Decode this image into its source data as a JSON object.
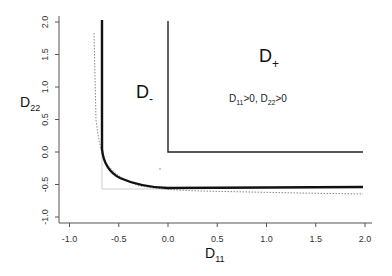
{
  "chart_data": {
    "type": "line",
    "title": "",
    "xlabel": "D11",
    "ylabel": "D22",
    "xlim": [
      -1.1,
      2.1
    ],
    "ylim": [
      -1.1,
      2.1
    ],
    "grid": false,
    "x_ticks": [
      "-1.0",
      "-0.5",
      "0.0",
      "0.5",
      "1.0",
      "1.5",
      "2.0"
    ],
    "y_ticks": [
      "-1.0",
      "-0.5",
      "0.0",
      "0.5",
      "1.0",
      "1.5",
      "2.0"
    ],
    "series": [
      {
        "name": "D- boundary (thick solid)",
        "style": "solid-thick",
        "points": [
          [
            -0.68,
            2.0
          ],
          [
            -0.68,
            0.05
          ],
          [
            -0.62,
            -0.2
          ],
          [
            -0.5,
            -0.36
          ],
          [
            -0.3,
            -0.48
          ],
          [
            -0.1,
            -0.54
          ],
          [
            0.0,
            -0.56
          ],
          [
            0.5,
            -0.56
          ],
          [
            2.0,
            -0.56
          ]
        ]
      },
      {
        "name": "D+ boundary (solid)",
        "style": "solid",
        "points": [
          [
            0.0,
            2.0
          ],
          [
            0.0,
            0.0
          ],
          [
            2.0,
            0.0
          ]
        ]
      },
      {
        "name": "asymptotic curve (dotted)",
        "style": "dotted",
        "points": [
          [
            -0.75,
            1.85
          ],
          [
            -0.7,
            0.2
          ],
          [
            -0.6,
            -0.25
          ],
          [
            -0.4,
            -0.46
          ],
          [
            0.0,
            -0.57
          ],
          [
            1.0,
            -0.62
          ],
          [
            2.0,
            -0.64
          ]
        ]
      },
      {
        "name": "reference lines (light gray)",
        "style": "thin-gray",
        "points": [
          [
            -0.68,
            0.05
          ],
          [
            -0.68,
            -0.57
          ],
          [
            0.0,
            -0.57
          ]
        ]
      }
    ],
    "annotations": [
      {
        "text": "D-",
        "x": -0.3,
        "y": 0.75
      },
      {
        "text": "D+",
        "x": 0.95,
        "y": 1.5
      },
      {
        "text": "D11>0, D22>0",
        "x": 1.0,
        "y": 0.85
      }
    ]
  },
  "labels": {
    "xlabel_main": "D",
    "xlabel_sub": "11",
    "ylabel_main": "D",
    "ylabel_sub": "22",
    "region_minus_main": "D",
    "region_minus_sub": "-",
    "region_plus_main": "D",
    "region_plus_sub": "+",
    "cond_d1": "D",
    "cond_s1": "11",
    "cond_t1": ">0, D",
    "cond_s2": "22",
    "cond_t2": ">0"
  }
}
